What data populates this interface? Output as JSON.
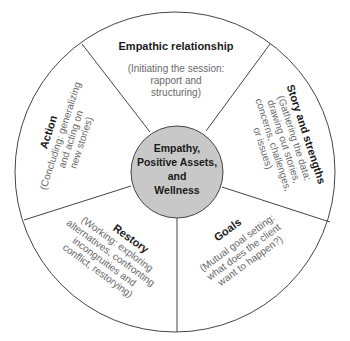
{
  "diagram": {
    "center": {
      "lines": [
        "Empathy,",
        "Positive Assets,",
        "and",
        "Wellness"
      ]
    },
    "segments": [
      {
        "id": "empathic-relationship",
        "title": "Empathic relationship",
        "subtitle_lines": [
          "(Initiating the session:",
          "rapport and",
          "structuring)"
        ]
      },
      {
        "id": "story-and-strengths",
        "title": "Story and strengths",
        "subtitle_lines": [
          "(Gathering the data:",
          "drawing out stories,",
          "concerns, challenges,",
          "or issues)"
        ]
      },
      {
        "id": "goals",
        "title": "Goals",
        "subtitle_lines": [
          "(Mutual goal setting:",
          "what does the client",
          "want to happen?)"
        ]
      },
      {
        "id": "restory",
        "title": "Restory",
        "subtitle_lines": [
          "(Working: exploring",
          "alternatives, confronting",
          "incongruities and",
          "conflict, restorying)"
        ]
      },
      {
        "id": "action",
        "title": "Action",
        "subtitle_lines": [
          "(Concluding: generalizing",
          "and acting on",
          "new stories)"
        ]
      }
    ],
    "colors": {
      "line": "#444444",
      "center_fill": "#c8c8c8",
      "title_text": "#1a1a1a",
      "subtitle_text": "#6a6a6a"
    }
  }
}
